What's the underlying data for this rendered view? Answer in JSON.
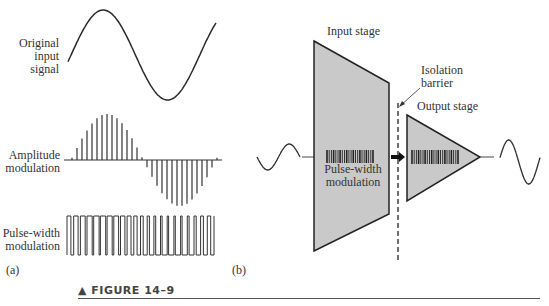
{
  "figure": {
    "caption": "▲ FIGURE 14–9",
    "panel_a": {
      "label": "(a)",
      "signals": [
        {
          "label_lines": [
            "Original",
            "input",
            "signal"
          ]
        },
        {
          "label_lines": [
            "Amplitude",
            "modulation"
          ]
        },
        {
          "label_lines": [
            "Pulse-width",
            "modulation"
          ]
        }
      ]
    },
    "panel_b": {
      "label": "(b)",
      "input_stage": {
        "title": "Input stage",
        "inner_label_lines": [
          "Pulse-width",
          "modulation"
        ]
      },
      "isolation_barrier": {
        "label_lines": [
          "Isolation",
          "barrier"
        ]
      },
      "output_stage": {
        "title": "Output stage"
      }
    },
    "colors": {
      "stage_fill": "#c9c9c9",
      "stroke": "#222222",
      "background": "#ffffff"
    }
  }
}
